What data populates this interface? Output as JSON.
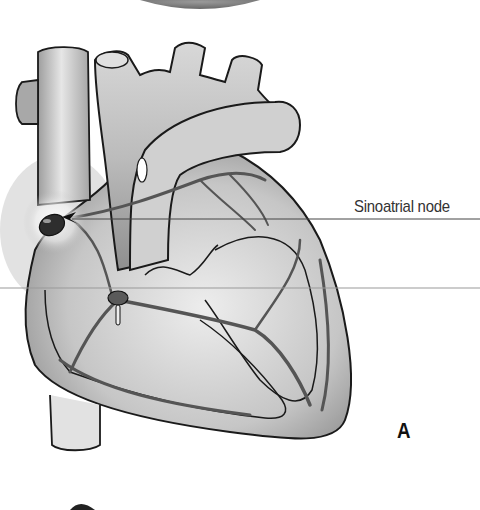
{
  "figure": {
    "panel_letter": "A",
    "labels": [
      {
        "text": "Sinoatrial node",
        "target": "sinoatrial-node"
      }
    ]
  },
  "colors": {
    "background": "#ffffff",
    "outline": "#1a1a1a",
    "tissue_light": "#e4e4e4",
    "tissue_mid": "#bdbdbd",
    "tissue_dark": "#8a8a8a",
    "conduction_path": "#555555",
    "leader_line": "#444444"
  }
}
